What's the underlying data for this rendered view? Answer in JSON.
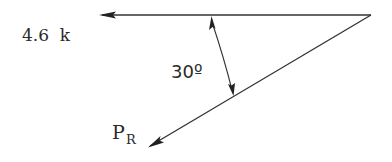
{
  "diagram": {
    "type": "force-vector-triangle",
    "force_label": "4.6  k",
    "angle_label": "30º",
    "resultant_label_main": "P",
    "resultant_label_sub": "R",
    "angle_degrees": 30,
    "line_color": "#333333",
    "text_color": "#2a2a2a"
  }
}
